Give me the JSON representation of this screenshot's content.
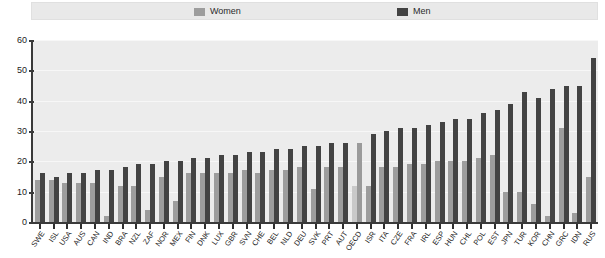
{
  "legend": {
    "women": {
      "label": "Women",
      "color": "#9d9d9d",
      "swatch_icon": "square-swatch-icon"
    },
    "men": {
      "label": "Men",
      "color": "#434343",
      "swatch_icon": "square-swatch-icon"
    }
  },
  "axis": {
    "y_ticks": [
      "0",
      "10",
      "20",
      "30",
      "40",
      "50",
      "60"
    ]
  },
  "highlight": {
    "category": "OECD",
    "women_color": "#c9c9c9",
    "men_color": "#9a9a9a"
  },
  "chart_data": {
    "type": "bar",
    "title": "",
    "subtitle": "",
    "xlabel": "",
    "ylabel": "",
    "ylim": [
      0,
      60
    ],
    "ytick_step": 10,
    "grid": true,
    "legend_position": "top",
    "orientation": "vertical",
    "categories": [
      "SWE",
      "ISL",
      "USA",
      "AUS",
      "CAN",
      "IND",
      "BRA",
      "NZL",
      "ZAF",
      "NOR",
      "MEX",
      "FIN",
      "DNK",
      "LUX",
      "GBR",
      "SVN",
      "CHE",
      "BEL",
      "NLD",
      "DEU",
      "SVK",
      "PRT",
      "AUT",
      "OECD",
      "ISR",
      "ITA",
      "CZE",
      "FRA",
      "IRL",
      "ESP",
      "HUN",
      "CHL",
      "POL",
      "EST",
      "JPN",
      "TUR",
      "KOR",
      "CHN",
      "GRC",
      "IDN",
      "RUS"
    ],
    "series": [
      {
        "name": "Women",
        "color": "#9d9d9d",
        "values": [
          14,
          14,
          13,
          13,
          13,
          2,
          12,
          12,
          4,
          15,
          7,
          16,
          16,
          16,
          16,
          17,
          16,
          17,
          17,
          18,
          11,
          18,
          18,
          12,
          12,
          18,
          18,
          19,
          19,
          20,
          20,
          20,
          21,
          22,
          10,
          10,
          6,
          2,
          31,
          3,
          15
        ]
      },
      {
        "name": "Men",
        "color": "#434343",
        "values": [
          16,
          15,
          16,
          16,
          17,
          17,
          18,
          19,
          19,
          20,
          20,
          21,
          21,
          22,
          22,
          23,
          23,
          24,
          24,
          25,
          25,
          26,
          26,
          26,
          29,
          30,
          31,
          31,
          32,
          33,
          34,
          34,
          36,
          37,
          39,
          43,
          41,
          44,
          45,
          45,
          54
        ]
      }
    ]
  }
}
